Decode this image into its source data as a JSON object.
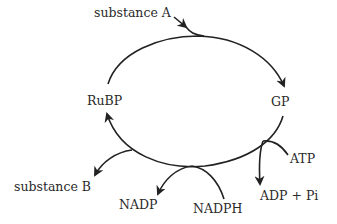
{
  "diagram": {
    "type": "cycle",
    "title": "",
    "nodes": {
      "substance_a": "substance A",
      "gp": "GP",
      "rubp": "RuBP",
      "substance_b": "substance B",
      "nadp": "NADP",
      "nadph": "NADPH",
      "atp": "ATP",
      "adp_pi": "ADP + Pi"
    },
    "edges": [
      {
        "from": "substance A",
        "to": "cycle (joins RuBP → GP arc)"
      },
      {
        "from": "RuBP",
        "to": "GP"
      },
      {
        "from": "GP",
        "to": "RuBP"
      },
      {
        "from": "ATP",
        "to": "ADP + Pi"
      },
      {
        "from": "NADPH",
        "to": "NADP"
      },
      {
        "from": "cycle",
        "to": "substance B"
      }
    ],
    "colors": {
      "line": "#222222",
      "text": "#2a2a2a",
      "background": "#ffffff"
    }
  }
}
